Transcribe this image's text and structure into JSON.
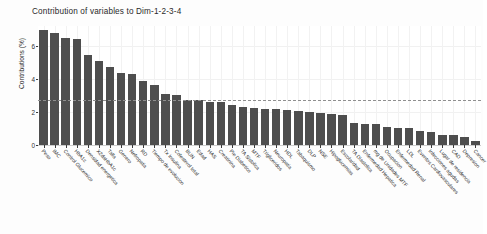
{
  "chart_data": {
    "type": "bar",
    "title": "Contribution of variables to Dim-1-2-3-4",
    "xlabel": "",
    "ylabel": "Contributions (%)",
    "ylim": [
      0,
      7.2
    ],
    "yticks": [
      0,
      2,
      4,
      6
    ],
    "ytick_labels": [
      "0",
      "2",
      "4",
      "6"
    ],
    "grid": true,
    "legend": "none",
    "reference_line": {
      "value": 2.7,
      "style": "dashed",
      "color": "#8f8f8f",
      "label": "expected average contribution"
    },
    "bar_color": "#4e4e4e",
    "categories": [
      "Peso",
      "IMC",
      "Control Glucemico",
      "HbA1c",
      "Densidad energetica",
      "X2daHbA1c",
      "Talla",
      "Genero",
      "Nefropatia",
      "RD",
      "Tiempo de evolucion",
      "Tx Insulina",
      "Colesterol total",
      "BUN",
      "Edad",
      "HAS",
      "Creatinina",
      "Pie Diabetico",
      "TA Sistolica",
      "MTF",
      "Trigliceridos",
      "Neuropatia",
      "HDL",
      "Tabaquismo",
      "DLP",
      "NSE",
      "Hipoglucemias",
      "Escolaridad",
      "TA Diastolica",
      "Enfermedad Hepatica",
      "mg de Unidades MTF",
      "Ocupacion",
      "Enfermedad Renal",
      "LDL",
      "Eventos Cardiovasculares",
      "Infecciones agudas",
      "Lugar de residencia",
      "CAD",
      "Depresion",
      "Cancer"
    ],
    "values": [
      6.95,
      6.75,
      6.5,
      6.4,
      5.45,
      5.1,
      4.7,
      4.35,
      4.3,
      3.85,
      3.65,
      3.1,
      3.0,
      2.75,
      2.7,
      2.62,
      2.58,
      2.4,
      2.3,
      2.25,
      2.2,
      2.15,
      2.1,
      2.05,
      2.0,
      1.95,
      1.9,
      1.8,
      1.35,
      1.3,
      1.3,
      1.1,
      1.05,
      1.0,
      0.85,
      0.8,
      0.62,
      0.58,
      0.5,
      0.22
    ]
  },
  "axes": {
    "y_title": "Contributions (%)"
  }
}
